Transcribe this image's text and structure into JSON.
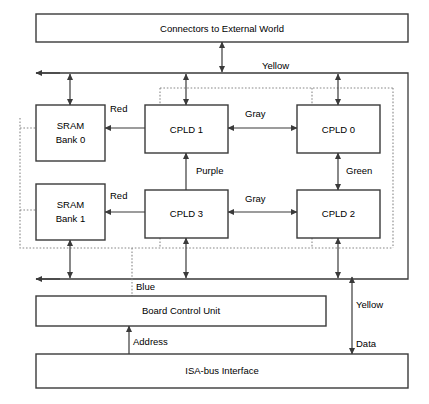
{
  "diagram": {
    "boxes": [
      {
        "id": "connectors",
        "label": "Connectors to External World",
        "x": 36,
        "y": 14,
        "w": 372,
        "h": 28
      },
      {
        "id": "sram0",
        "label": "SRAM",
        "label2": "Bank 0",
        "x": 36,
        "y": 105,
        "w": 69,
        "h": 56
      },
      {
        "id": "cpld1",
        "label": "CPLD 1",
        "x": 145,
        "y": 105,
        "w": 83,
        "h": 48
      },
      {
        "id": "cpld0",
        "label": "CPLD 0",
        "x": 297,
        "y": 105,
        "w": 83,
        "h": 48
      },
      {
        "id": "sram1",
        "label": "SRAM",
        "label2": "Bank 1",
        "x": 36,
        "y": 184,
        "w": 69,
        "h": 56
      },
      {
        "id": "cpld3",
        "label": "CPLD 3",
        "x": 145,
        "y": 190,
        "w": 83,
        "h": 48
      },
      {
        "id": "cpld2",
        "label": "CPLD 2",
        "x": 297,
        "y": 190,
        "w": 83,
        "h": 48
      },
      {
        "id": "bcu",
        "label": "Board Control Unit",
        "x": 36,
        "y": 296,
        "w": 290,
        "h": 30
      },
      {
        "id": "isa",
        "label": "ISA-bus Interface",
        "x": 36,
        "y": 354,
        "w": 372,
        "h": 34
      }
    ],
    "wire_labels": [
      {
        "id": "yellow-top",
        "text": "Yellow",
        "x": 262,
        "y": 66
      },
      {
        "id": "red-top",
        "text": "Red",
        "x": 110,
        "y": 109
      },
      {
        "id": "gray-top",
        "text": "Gray",
        "x": 245,
        "y": 114
      },
      {
        "id": "purple",
        "text": "Purple",
        "x": 196,
        "y": 171
      },
      {
        "id": "green",
        "text": "Green",
        "x": 346,
        "y": 171
      },
      {
        "id": "red-bottom",
        "text": "Red",
        "x": 110,
        "y": 196
      },
      {
        "id": "gray-bottom",
        "text": "Gray",
        "x": 245,
        "y": 199
      },
      {
        "id": "blue",
        "text": "Blue",
        "x": 136,
        "y": 287
      },
      {
        "id": "yellow-right",
        "text": "Yellow",
        "x": 356,
        "y": 305
      },
      {
        "id": "address",
        "text": "Address",
        "x": 133,
        "y": 342
      },
      {
        "id": "data",
        "text": "Data",
        "x": 356,
        "y": 344
      }
    ]
  }
}
